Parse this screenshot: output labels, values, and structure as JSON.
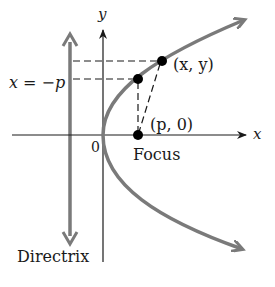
{
  "figure": {
    "type": "parabola-focus-directrix",
    "colors": {
      "curve": "#7a7a7a",
      "directrix": "#7a7a7a",
      "axes": "#1a1a1a",
      "points": "#000000",
      "background": "#ffffff"
    }
  },
  "labels": {
    "y_axis": "y",
    "x_axis": "x",
    "origin": "0",
    "directrix_eq": "x = −p",
    "point": "(x, y)",
    "focus_coords": "(p, 0)",
    "focus": "Focus",
    "directrix": "Directrix"
  }
}
